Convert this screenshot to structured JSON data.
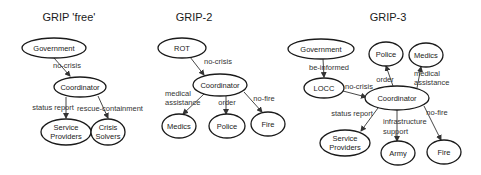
{
  "diagrams": [
    {
      "title": "GRIP 'free'",
      "nodes": [
        {
          "id": "government",
          "label": "Government"
        },
        {
          "id": "coordinator",
          "label": "Coordinator"
        },
        {
          "id": "service_providers",
          "label_lines": [
            "Service",
            "Providers"
          ]
        },
        {
          "id": "crisis_solvers",
          "label_lines": [
            "Crisis",
            "Solvers"
          ]
        }
      ],
      "edges": [
        {
          "from": "government",
          "to": "coordinator",
          "label": "no-crisis"
        },
        {
          "from": "coordinator",
          "to": "service_providers",
          "label": "status report"
        },
        {
          "from": "coordinator",
          "to": "crisis_solvers",
          "label": "rescue-containment"
        }
      ]
    },
    {
      "title": "GRIP-2",
      "nodes": [
        {
          "id": "rot",
          "label": "ROT"
        },
        {
          "id": "coordinator",
          "label": "Coordinator"
        },
        {
          "id": "medics",
          "label": "Medics"
        },
        {
          "id": "police",
          "label": "Police"
        },
        {
          "id": "fire",
          "label": "Fire"
        }
      ],
      "edges": [
        {
          "from": "rot",
          "to": "coordinator",
          "label": "no-crisis"
        },
        {
          "from": "coordinator",
          "to": "medics",
          "label_lines": [
            "medical",
            "assistance"
          ]
        },
        {
          "from": "coordinator",
          "to": "police",
          "label": "order"
        },
        {
          "from": "coordinator",
          "to": "fire",
          "label": "no-fire"
        }
      ]
    },
    {
      "title": "GRIP-3",
      "nodes": [
        {
          "id": "government",
          "label": "Government"
        },
        {
          "id": "locc",
          "label": "LOCC"
        },
        {
          "id": "police",
          "label": "Police"
        },
        {
          "id": "medics",
          "label": "Medics"
        },
        {
          "id": "coordinator",
          "label": "Coordinator"
        },
        {
          "id": "service_providers",
          "label_lines": [
            "Service",
            "Providers"
          ]
        },
        {
          "id": "army",
          "label": "Army"
        },
        {
          "id": "fire",
          "label": "Fire"
        }
      ],
      "edges": [
        {
          "from": "government",
          "to": "locc",
          "label": "be-informed"
        },
        {
          "from": "locc",
          "to": "coordinator",
          "label": "no-crisis"
        },
        {
          "from": "coordinator",
          "to": "police",
          "label": "order"
        },
        {
          "from": "coordinator",
          "to": "medics",
          "label_lines": [
            "medical",
            "assistance"
          ]
        },
        {
          "from": "coordinator",
          "to": "service_providers",
          "label": "status report"
        },
        {
          "from": "coordinator",
          "to": "army",
          "label_lines": [
            "infrastructure",
            "support"
          ]
        },
        {
          "from": "coordinator",
          "to": "fire",
          "label": "no-fire"
        }
      ]
    }
  ]
}
